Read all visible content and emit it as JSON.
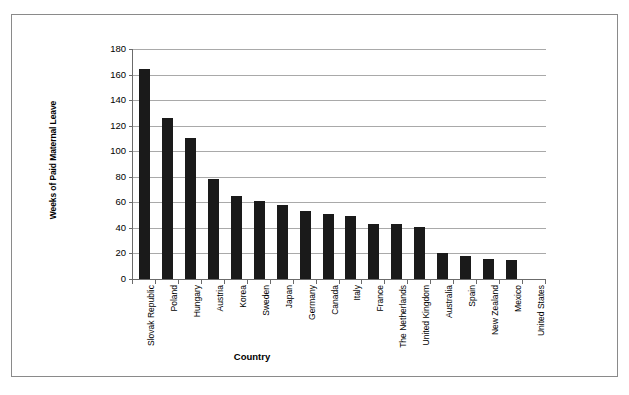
{
  "figure": {
    "frame_color": "#8a8a8a",
    "background": "#ffffff"
  },
  "chart_data": {
    "type": "bar",
    "title": "",
    "xlabel": "Country",
    "ylabel": "Weeks of Paid Maternal Leave",
    "ylim": [
      0,
      180
    ],
    "ytick_step": 20,
    "grid": true,
    "legend": "none",
    "bar_color": "#1a1a1a",
    "ytick_labels": [
      "180",
      "160",
      "140",
      "120",
      "100",
      "80",
      "60",
      "40",
      "20",
      "0"
    ],
    "yticks": [
      180,
      160,
      140,
      120,
      100,
      80,
      60,
      40,
      20,
      0
    ],
    "categories": [
      "Slovak Republic",
      "Poland",
      "Hungary",
      "Austria",
      "Korea",
      "Sweden",
      "Japan",
      "Germany",
      "Canada",
      "Italy",
      "France",
      "The Netherlands",
      "United Kingdom",
      "Australia",
      "Spain",
      "New Zealand",
      "Mexico",
      "United States"
    ],
    "values": [
      164,
      126,
      110,
      78,
      65,
      61,
      58,
      53,
      51,
      49,
      43,
      43,
      41,
      20,
      18,
      16,
      15,
      0
    ]
  }
}
